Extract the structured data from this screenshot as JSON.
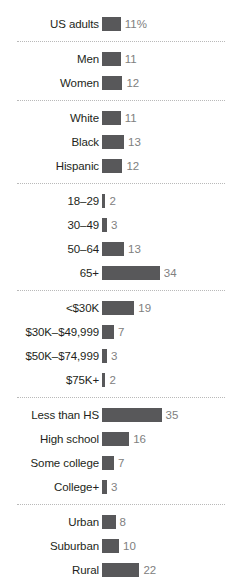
{
  "chart_data": {
    "type": "bar",
    "orientation": "horizontal",
    "title": "",
    "subtitle": "",
    "xlabel": "",
    "ylabel": "",
    "unit_suffix": "%",
    "xlim": [
      0,
      35
    ],
    "grid": false,
    "legend": "none",
    "bar_color": "#58585a",
    "label_color": "#231f20",
    "value_color": "#808080",
    "separator_color": "#b9b9b9",
    "px_per_unit": 1.7,
    "categories": [
      "US adults",
      "Men",
      "Women",
      "White",
      "Black",
      "Hispanic",
      "18–29",
      "30–49",
      "50–64",
      "65+",
      "<$30K",
      "$30K–$49,999",
      "$50K–$74,999",
      "$75K+",
      "Less than HS",
      "High school",
      "Some college",
      "College+",
      "Urban",
      "Suburban",
      "Rural"
    ],
    "values": [
      11,
      11,
      12,
      11,
      13,
      12,
      2,
      3,
      13,
      34,
      19,
      7,
      3,
      2,
      35,
      16,
      7,
      3,
      8,
      10,
      22
    ],
    "groups": [
      {
        "name": "total",
        "rows": [
          {
            "label": "US adults",
            "value": 11,
            "value_text": "11%"
          }
        ]
      },
      {
        "name": "gender",
        "rows": [
          {
            "label": "Men",
            "value": 11,
            "value_text": "11"
          },
          {
            "label": "Women",
            "value": 12,
            "value_text": "12"
          }
        ]
      },
      {
        "name": "race-ethnicity",
        "rows": [
          {
            "label": "White",
            "value": 11,
            "value_text": "11"
          },
          {
            "label": "Black",
            "value": 13,
            "value_text": "13"
          },
          {
            "label": "Hispanic",
            "value": 12,
            "value_text": "12"
          }
        ]
      },
      {
        "name": "age",
        "rows": [
          {
            "label": "18–29",
            "value": 2,
            "value_text": "2"
          },
          {
            "label": "30–49",
            "value": 3,
            "value_text": "3"
          },
          {
            "label": "50–64",
            "value": 13,
            "value_text": "13"
          },
          {
            "label": "65+",
            "value": 34,
            "value_text": "34"
          }
        ]
      },
      {
        "name": "income",
        "rows": [
          {
            "label": "<$30K",
            "value": 19,
            "value_text": "19"
          },
          {
            "label": "$30K–$49,999",
            "value": 7,
            "value_text": "7"
          },
          {
            "label": "$50K–$74,999",
            "value": 3,
            "value_text": "3"
          },
          {
            "label": "$75K+",
            "value": 2,
            "value_text": "2"
          }
        ]
      },
      {
        "name": "education",
        "rows": [
          {
            "label": "Less than HS",
            "value": 35,
            "value_text": "35"
          },
          {
            "label": "High school",
            "value": 16,
            "value_text": "16"
          },
          {
            "label": "Some college",
            "value": 7,
            "value_text": "7"
          },
          {
            "label": "College+",
            "value": 3,
            "value_text": "3"
          }
        ]
      },
      {
        "name": "community-type",
        "rows": [
          {
            "label": "Urban",
            "value": 8,
            "value_text": "8"
          },
          {
            "label": "Suburban",
            "value": 10,
            "value_text": "10"
          },
          {
            "label": "Rural",
            "value": 22,
            "value_text": "22"
          }
        ]
      }
    ]
  }
}
